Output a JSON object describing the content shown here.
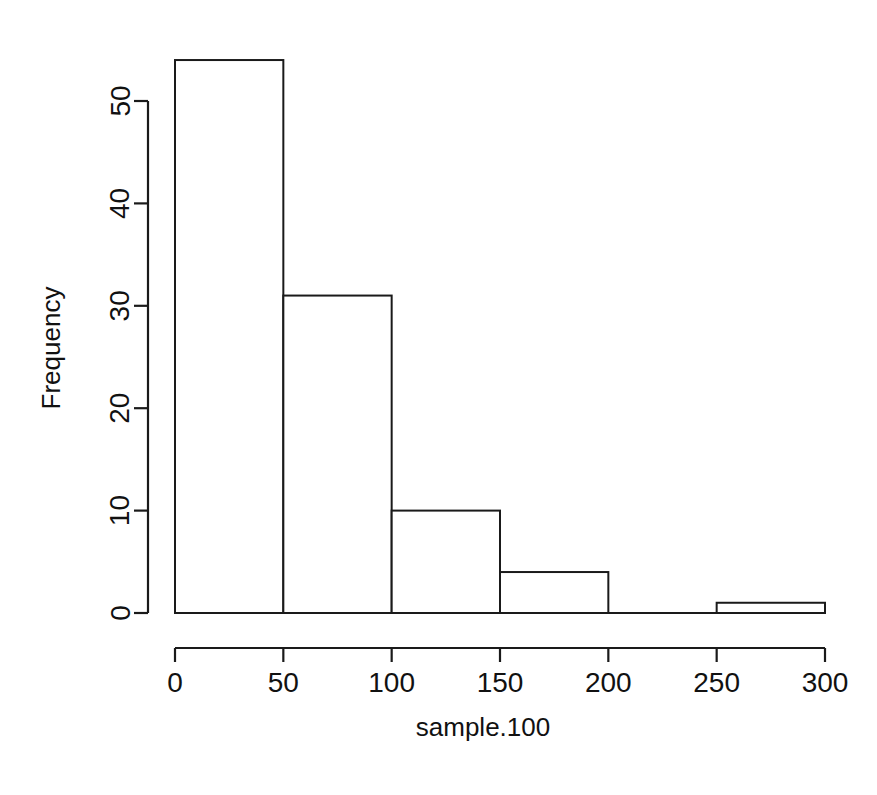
{
  "chart_data": {
    "type": "bar",
    "subtype": "histogram",
    "title": "",
    "xlabel": "sample.100",
    "ylabel": "Frequency",
    "categories": [
      "0-50",
      "50-100",
      "100-150",
      "150-200",
      "200-250",
      "250-300"
    ],
    "bin_edges": [
      0,
      50,
      100,
      150,
      200,
      250,
      300
    ],
    "bin_width": 50,
    "values": [
      54,
      31,
      10,
      4,
      0,
      1
    ],
    "total_count": 100,
    "xlim": [
      0,
      300
    ],
    "ylim": [
      0,
      54
    ],
    "x_ticks": [
      0,
      50,
      100,
      150,
      200,
      250,
      300
    ],
    "x_tick_labels": [
      "0",
      "50",
      "100",
      "150",
      "200",
      "250",
      "300"
    ],
    "y_ticks": [
      0,
      10,
      20,
      30,
      40,
      50
    ],
    "y_tick_labels": [
      "0",
      "10",
      "20",
      "30",
      "40",
      "50"
    ],
    "y_axis_line_range": [
      0,
      50
    ],
    "grid": false,
    "legend": false,
    "bar_fill_color": "#ffffff",
    "bar_border_color": "#1a1a1a",
    "background_color": "#ffffff",
    "axis_color": "#1a1a1a",
    "y_label_rotation": -90
  },
  "labels": {
    "x_axis_title": "sample.100",
    "y_axis_title": "Frequency"
  }
}
